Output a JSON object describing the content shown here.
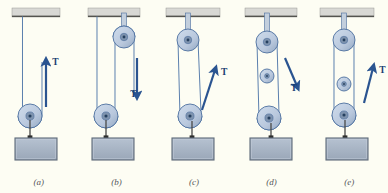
{
  "figure": {
    "background_color": "#fdfdf3",
    "panel_width": 77.6,
    "panels": [
      {
        "id": "a",
        "label": "(a)",
        "x": 0,
        "tension_label": "T",
        "arrow_direction": "up",
        "pulley_count": 1,
        "fixed_pulleys": 0,
        "movable_pulleys": 1,
        "arrow": {
          "x1": 46,
          "y1": 107,
          "x2": 46,
          "y2": 62
        },
        "ceiling": {
          "x": 12,
          "y": 8,
          "w": 48,
          "h": 9
        },
        "block": {
          "x": 15,
          "y": 138,
          "w": 42,
          "h": 22
        },
        "pulleys": [
          {
            "cx": 30,
            "cy": 116,
            "r": 12,
            "type": "movable"
          }
        ],
        "ropes": [
          {
            "type": "line",
            "x1": 22.5,
            "y1": 16.5,
            "x2": 22.5,
            "y2": 116
          },
          {
            "type": "line",
            "x1": 42,
            "y1": 116,
            "x2": 42,
            "y2": 62
          },
          {
            "type": "arc",
            "cx": 30,
            "cy": 116,
            "r": 12
          }
        ],
        "hook": {
          "x": 30,
          "y1": 120,
          "y2": 138
        }
      },
      {
        "id": "b",
        "label": "(b)",
        "x": 77.6,
        "tension_label": "T",
        "arrow_direction": "down",
        "pulley_count": 2,
        "fixed_pulleys": 1,
        "movable_pulleys": 1,
        "arrow": {
          "x1": 59,
          "y1": 58,
          "x2": 59,
          "y2": 95
        },
        "ceiling": {
          "x": 10,
          "y": 8,
          "w": 52,
          "h": 9
        },
        "block": {
          "x": 14,
          "y": 138,
          "w": 42,
          "h": 22
        },
        "pulleys": [
          {
            "cx": 46,
            "cy": 37,
            "r": 11,
            "type": "fixed"
          },
          {
            "cx": 28,
            "cy": 116,
            "r": 12,
            "type": "movable"
          }
        ],
        "ropes": [
          {
            "type": "line",
            "x1": 19,
            "y1": 16.5,
            "x2": 19,
            "y2": 116
          },
          {
            "type": "line",
            "x1": 37,
            "y1": 116,
            "x2": 37,
            "y2": 37
          },
          {
            "type": "line",
            "x1": 56,
            "y1": 37,
            "x2": 56,
            "y2": 95
          },
          {
            "type": "arc",
            "cx": 28,
            "cy": 116,
            "r": 12
          },
          {
            "type": "arc-top",
            "cx": 46,
            "cy": 37,
            "r": 11
          }
        ],
        "hook": {
          "x": 28,
          "y1": 120,
          "y2": 138
        },
        "bracket": {
          "x": 46,
          "y1": 13,
          "y2": 37
        }
      },
      {
        "id": "c",
        "label": "(c)",
        "x": 155.2,
        "tension_label": "T",
        "arrow_direction": "up-right",
        "pulley_count": 2,
        "fixed_pulleys": 1,
        "movable_pulleys": 1,
        "arrow": {
          "x1": 47,
          "y1": 110,
          "x2": 60,
          "y2": 70
        },
        "ceiling": {
          "x": 11,
          "y": 8,
          "w": 54,
          "h": 9
        },
        "block": {
          "x": 17,
          "y": 138,
          "w": 42,
          "h": 22
        },
        "pulleys": [
          {
            "cx": 33,
            "cy": 40,
            "r": 11,
            "type": "fixed"
          },
          {
            "cx": 35,
            "cy": 116,
            "r": 12,
            "type": "movable"
          }
        ],
        "ropes": [
          {
            "type": "line",
            "x1": 23,
            "y1": 40,
            "x2": 25,
            "y2": 116
          },
          {
            "type": "line",
            "x1": 43,
            "y1": 40,
            "x2": 46,
            "y2": 112
          },
          {
            "type": "arc",
            "cx": 35,
            "cy": 116,
            "r": 12
          }
        ],
        "hook": {
          "x": 37,
          "y1": 121,
          "y2": 138
        },
        "bracket": {
          "x": 33,
          "y1": 13,
          "y2": 40
        }
      },
      {
        "id": "d",
        "label": "(d)",
        "x": 232.8,
        "tension_label": "T",
        "arrow_direction": "down-right",
        "pulley_count": 3,
        "fixed_pulleys": 1,
        "movable_pulleys": 2,
        "arrow": {
          "x1": 52,
          "y1": 58,
          "x2": 64,
          "y2": 86
        },
        "ceiling": {
          "x": 12,
          "y": 8,
          "w": 52,
          "h": 9
        },
        "block": {
          "x": 17,
          "y": 138,
          "w": 42,
          "h": 22
        },
        "pulleys": [
          {
            "cx": 34,
            "cy": 42,
            "r": 11,
            "type": "fixed"
          },
          {
            "cx": 34,
            "cy": 76,
            "r": 7,
            "type": "movable"
          },
          {
            "cx": 36,
            "cy": 118,
            "r": 12,
            "type": "movable"
          }
        ],
        "ropes": [
          {
            "type": "line",
            "x1": 24,
            "y1": 42,
            "x2": 26,
            "y2": 118
          },
          {
            "type": "line",
            "x1": 44,
            "y1": 42,
            "x2": 46,
            "y2": 114
          },
          {
            "type": "arc",
            "cx": 36,
            "cy": 118,
            "r": 12
          }
        ],
        "hook": {
          "x": 38,
          "y1": 123,
          "y2": 138
        },
        "bracket": {
          "x": 34,
          "y1": 13,
          "y2": 42
        }
      },
      {
        "id": "e",
        "label": "(e)",
        "x": 310.4,
        "tension_label": "T",
        "arrow_direction": "up-right",
        "pulley_count": 3,
        "fixed_pulleys": 1,
        "movable_pulleys": 2,
        "arrow": {
          "x1": 54,
          "y1": 103,
          "x2": 63,
          "y2": 68
        },
        "ceiling": {
          "x": 10,
          "y": 8,
          "w": 54,
          "h": 9
        },
        "block": {
          "x": 16,
          "y": 138,
          "w": 42,
          "h": 22
        },
        "pulleys": [
          {
            "cx": 34,
            "cy": 40,
            "r": 11,
            "type": "fixed"
          },
          {
            "cx": 34,
            "cy": 84,
            "r": 7,
            "type": "movable"
          },
          {
            "cx": 34,
            "cy": 115,
            "r": 12,
            "type": "movable"
          }
        ],
        "ropes": [
          {
            "type": "line",
            "x1": 24,
            "y1": 40,
            "x2": 24,
            "y2": 115
          },
          {
            "type": "line",
            "x1": 44,
            "y1": 40,
            "x2": 44,
            "y2": 115
          },
          {
            "type": "arc",
            "cx": 34,
            "cy": 115,
            "r": 12
          }
        ],
        "hook": {
          "x": 35,
          "y1": 120,
          "y2": 138
        },
        "bracket": {
          "x": 34,
          "y1": 13,
          "y2": 40
        }
      }
    ],
    "colors": {
      "background": "#fdfdf3",
      "rope": "#5b7fae",
      "arrow": "#2a5490",
      "arrow_label": "#1b3f73",
      "block_fill": "#a8b4c4",
      "block_stroke": "#5e6a78",
      "ceiling_fill": "#d8d8d4",
      "ceiling_edge": "#54544f",
      "pulley_fill": "#b9c8dd",
      "pulley_stroke": "#4d6f9e",
      "pulley_hub": "#7e93ae",
      "label_text": "#55555a"
    }
  }
}
